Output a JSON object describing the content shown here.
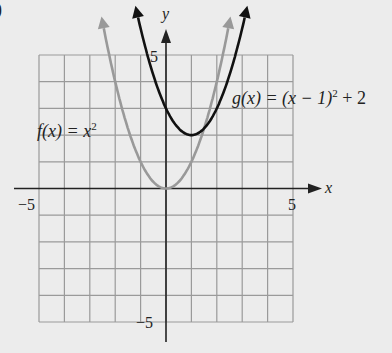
{
  "part_label": ")",
  "chart_data": {
    "type": "line",
    "title": "",
    "xlabel": "x",
    "ylabel": "y",
    "xlim": [
      -5,
      5
    ],
    "ylim": [
      -5,
      5
    ],
    "grid": true,
    "x_tick_labels": [
      "-5",
      "5"
    ],
    "y_tick_labels": [
      "5",
      "-5"
    ],
    "series": [
      {
        "name": "f(x) = x^2",
        "label": "f(x) = x²",
        "color": "#999999",
        "x": [
          -2.6,
          -2,
          -1,
          0,
          1,
          2,
          2.6
        ],
        "y": [
          6.76,
          4,
          1,
          0,
          1,
          4,
          6.76
        ]
      },
      {
        "name": "g(x) = (x - 1)^2 + 2",
        "label": "g(x) = (x − 1)² + 2",
        "color": "#111111",
        "x": [
          -1.2,
          -1,
          0,
          1,
          2,
          3,
          3.2
        ],
        "y": [
          6.84,
          6,
          3,
          2,
          3,
          6,
          6.84
        ]
      }
    ]
  },
  "labels": {
    "y_axis": "y",
    "x_axis": "x",
    "x_min": "−5",
    "x_max": "5",
    "y_max": "5",
    "y_min": "−5",
    "f_name": "f(x) = x",
    "f_exp": "2",
    "g_name": "g(x) = (x − 1)",
    "g_exp": "2",
    "g_tail": " + 2"
  }
}
